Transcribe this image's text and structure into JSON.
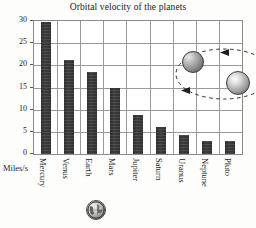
{
  "chart_data": {
    "type": "bar",
    "title": "Orbital velocity of the planets",
    "categories": [
      "Mercury",
      "Venus",
      "Earth",
      "Mars",
      "Jupiter",
      "Saturn",
      "Uranus",
      "Neptune",
      "Pluto"
    ],
    "values": [
      29.7,
      21.1,
      18.6,
      15.0,
      8.7,
      6.1,
      4.3,
      3.0,
      3.0
    ],
    "xlabel": "",
    "ylabel": "Miles/s",
    "ylim": [
      0,
      30
    ],
    "yticks": [
      0,
      5,
      10,
      15,
      20,
      25,
      30
    ],
    "ytick_labels": [
      "0",
      "5",
      "10",
      "15",
      "20",
      "25",
      "30"
    ],
    "grid": true,
    "legend": false,
    "bar_color": "#343434",
    "annotations": [
      {
        "name": "orbit-diagram",
        "description": "Dashed elliptical orbit with arrowheads showing a textured planet orbiting a bright sphere"
      },
      {
        "name": "earth-globe-glyph",
        "description": "Small globe icon beneath the Earth category label"
      }
    ]
  },
  "axis": {
    "unit_label": "Miles/s"
  },
  "colors": {
    "bar": "#343434",
    "grid": "#9a9a9a",
    "frame": "#8a8a8a",
    "text": "#1a1a1a",
    "background": "#fdfdfb"
  }
}
